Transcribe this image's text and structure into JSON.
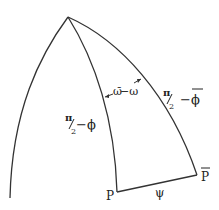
{
  "diagram": {
    "type": "spherical-triangle",
    "stroke_color": "#333333",
    "background": "#ffffff",
    "vertices": {
      "apex": {
        "label": "",
        "x": 68,
        "y": 17
      },
      "P": {
        "label": "P",
        "x": 117,
        "y": 192
      },
      "P_bar": {
        "label": "P",
        "overbar": true,
        "x": 197,
        "y": 175
      }
    },
    "labels": {
      "angle": {
        "text_a": "ω̄",
        "text_b": "−ω"
      },
      "side_left": {
        "num": "π",
        "den": "2",
        "rest": "−ϕ"
      },
      "side_right": {
        "num": "π",
        "den": "2",
        "rest": "−ϕ",
        "rest_overbar": true
      },
      "side_bottom": {
        "text": "ψ"
      },
      "vertex_P": {
        "text": "P"
      },
      "vertex_P_bar": {
        "text": "P"
      }
    }
  }
}
